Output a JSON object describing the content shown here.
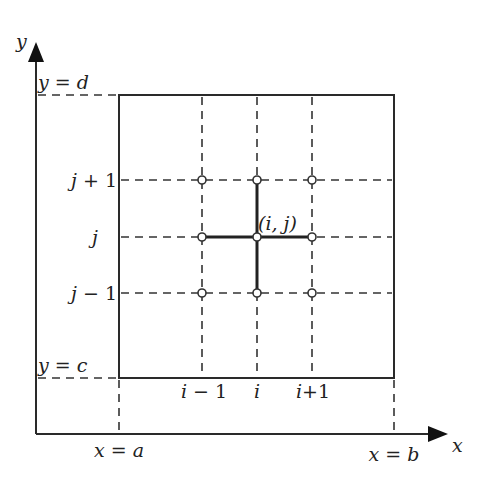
{
  "diagram": {
    "axes": {
      "x_label": "x",
      "y_label": "y"
    },
    "boundaries": {
      "left": "x = a",
      "right": "x = b",
      "bottom": "y = c",
      "top": "y = d"
    },
    "column_labels": [
      {
        "var": "i",
        "op": " − ",
        "num": "1"
      },
      {
        "var": "i",
        "op": "",
        "num": ""
      },
      {
        "var": "i",
        "op": "+",
        "num": "1"
      }
    ],
    "row_labels": [
      {
        "var": "j",
        "op": " + ",
        "num": "1"
      },
      {
        "var": "j",
        "op": "",
        "num": ""
      },
      {
        "var": "j",
        "op": " − ",
        "num": "1"
      }
    ],
    "center_node_label": "(i, j)",
    "nodes": [
      {
        "col": "i-1",
        "row": "j+1"
      },
      {
        "col": "i",
        "row": "j+1"
      },
      {
        "col": "i+1",
        "row": "j+1"
      },
      {
        "col": "i-1",
        "row": "j"
      },
      {
        "col": "i",
        "row": "j"
      },
      {
        "col": "i+1",
        "row": "j"
      },
      {
        "col": "i-1",
        "row": "j-1"
      },
      {
        "col": "i",
        "row": "j-1"
      },
      {
        "col": "i+1",
        "row": "j-1"
      }
    ],
    "stencil": "five-point cross centered at (i, j)",
    "colors": {
      "line": "#2a2a2a",
      "background": "#ffffff"
    }
  }
}
